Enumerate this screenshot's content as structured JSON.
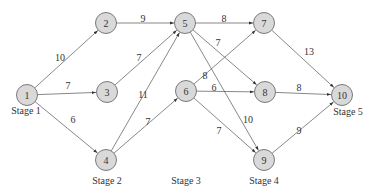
{
  "diagram": {
    "type": "staged-network",
    "nodes": [
      {
        "id": "1",
        "label": "1",
        "x": 27,
        "y": 95
      },
      {
        "id": "2",
        "label": "2",
        "x": 106,
        "y": 23
      },
      {
        "id": "3",
        "label": "3",
        "x": 107,
        "y": 92
      },
      {
        "id": "4",
        "label": "4",
        "x": 106,
        "y": 160
      },
      {
        "id": "5",
        "label": "5",
        "x": 185,
        "y": 23
      },
      {
        "id": "6",
        "label": "6",
        "x": 186,
        "y": 91
      },
      {
        "id": "7",
        "label": "7",
        "x": 264,
        "y": 23
      },
      {
        "id": "8",
        "label": "8",
        "x": 265,
        "y": 92
      },
      {
        "id": "9",
        "label": "9",
        "x": 264,
        "y": 160
      },
      {
        "id": "10",
        "label": "10",
        "x": 342,
        "y": 95
      }
    ],
    "edges": [
      {
        "from": "1",
        "to": "2",
        "weight": "10",
        "lx": 60,
        "ly": 57
      },
      {
        "from": "1",
        "to": "3",
        "weight": "7",
        "lx": 68,
        "ly": 85
      },
      {
        "from": "1",
        "to": "4",
        "weight": "6",
        "lx": 73,
        "ly": 119
      },
      {
        "from": "2",
        "to": "5",
        "weight": "9",
        "lx": 143,
        "ly": 18
      },
      {
        "from": "3",
        "to": "5",
        "weight": "7",
        "lx": 139,
        "ly": 57
      },
      {
        "from": "4",
        "to": "5",
        "weight": "11",
        "lx": 143,
        "ly": 94
      },
      {
        "from": "4",
        "to": "6",
        "weight": "7",
        "lx": 148,
        "ly": 121
      },
      {
        "from": "5",
        "to": "7",
        "weight": "8",
        "lx": 224,
        "ly": 18
      },
      {
        "from": "5",
        "to": "8",
        "weight": "7",
        "lx": 218,
        "ly": 42
      },
      {
        "from": "5",
        "to": "9",
        "weight": "10",
        "lx": 248,
        "ly": 119
      },
      {
        "from": "6",
        "to": "7",
        "weight": "8",
        "lx": 205,
        "ly": 75
      },
      {
        "from": "6",
        "to": "8",
        "weight": "6",
        "lx": 214,
        "ly": 87
      },
      {
        "from": "6",
        "to": "9",
        "weight": "7",
        "lx": 219,
        "ly": 130
      },
      {
        "from": "7",
        "to": "10",
        "weight": "13",
        "lx": 309,
        "ly": 51
      },
      {
        "from": "8",
        "to": "10",
        "weight": "8",
        "lx": 299,
        "ly": 87
      },
      {
        "from": "9",
        "to": "10",
        "weight": "9",
        "lx": 299,
        "ly": 130
      }
    ],
    "stages": [
      {
        "label": "Stage 1",
        "x": 26,
        "y": 110
      },
      {
        "label": "Stage 2",
        "x": 107,
        "y": 180
      },
      {
        "label": "Stage 3",
        "x": 186,
        "y": 180
      },
      {
        "label": "Stage 4",
        "x": 264,
        "y": 180
      },
      {
        "label": "Stage 5",
        "x": 348,
        "y": 111
      }
    ],
    "colors": {
      "node_fill": "#d9d9d9",
      "node_stroke": "#7a7a7a",
      "edge": "#555555",
      "text": "#333333"
    }
  }
}
